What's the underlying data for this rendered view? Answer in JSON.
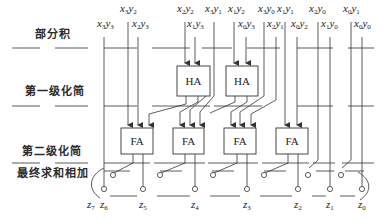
{
  "diagram": {
    "type": "wallace-tree-multiplier-4x4",
    "stage_labels": [
      {
        "id": "partial-products",
        "text": "部分积",
        "x": 35,
        "y": 33
      },
      {
        "id": "first-reduction",
        "text": "第一级化简",
        "x": 25,
        "y": 90
      },
      {
        "id": "second-reduction",
        "text": "第二级化简",
        "x": 22,
        "y": 150
      },
      {
        "id": "final-add",
        "text": "最终求和相加",
        "x": 17,
        "y": 172
      }
    ],
    "partial_products": [
      {
        "x_idx": "3",
        "y_idx": "3",
        "left": 97,
        "top": 26
      },
      {
        "x_idx": "3",
        "y_idx": "2",
        "left": 120,
        "top": 11
      },
      {
        "x_idx": "2",
        "y_idx": "3",
        "left": 132,
        "top": 26
      },
      {
        "x_idx": "2",
        "y_idx": "2",
        "left": 177,
        "top": 11
      },
      {
        "x_idx": "1",
        "y_idx": "3",
        "left": 187,
        "top": 26
      },
      {
        "x_idx": "3",
        "y_idx": "1",
        "left": 205,
        "top": 11
      },
      {
        "x_idx": "1",
        "y_idx": "2",
        "left": 228,
        "top": 11
      },
      {
        "x_idx": "0",
        "y_idx": "3",
        "left": 238,
        "top": 26
      },
      {
        "x_idx": "3",
        "y_idx": "0",
        "left": 258,
        "top": 11
      },
      {
        "x_idx": "1",
        "y_idx": "1",
        "left": 277,
        "top": 11
      },
      {
        "x_idx": "2",
        "y_idx": "1",
        "left": 267,
        "top": 26
      },
      {
        "x_idx": "0",
        "y_idx": "2",
        "left": 291,
        "top": 26
      },
      {
        "x_idx": "2",
        "y_idx": "0",
        "left": 309,
        "top": 11
      },
      {
        "x_idx": "1",
        "y_idx": "0",
        "left": 321,
        "top": 26
      },
      {
        "x_idx": "0",
        "y_idx": "1",
        "left": 343,
        "top": 11
      },
      {
        "x_idx": "0",
        "y_idx": "0",
        "left": 354,
        "top": 26
      }
    ],
    "half_adders": [
      {
        "label": "HA",
        "x": 177,
        "y": 66,
        "w": 33,
        "h": 30
      },
      {
        "label": "HA",
        "x": 226,
        "y": 66,
        "w": 32,
        "h": 30
      }
    ],
    "full_adders": [
      {
        "label": "FA",
        "x": 121,
        "y": 128,
        "w": 32,
        "h": 26
      },
      {
        "label": "FA",
        "x": 173,
        "y": 128,
        "w": 31,
        "h": 26
      },
      {
        "label": "FA",
        "x": 224,
        "y": 128,
        "w": 32,
        "h": 26
      },
      {
        "label": "FA",
        "x": 276,
        "y": 128,
        "w": 32,
        "h": 26
      }
    ],
    "outputs": [
      {
        "name": "z",
        "idx": "7",
        "left": 87,
        "top": 196
      },
      {
        "name": "z",
        "idx": "6",
        "left": 100,
        "top": 196
      },
      {
        "name": "z",
        "idx": "5",
        "left": 139,
        "top": 196
      },
      {
        "name": "z",
        "idx": "4",
        "left": 191,
        "top": 196
      },
      {
        "name": "z",
        "idx": "3",
        "left": 243,
        "top": 196
      },
      {
        "name": "z",
        "idx": "2",
        "left": 294,
        "top": 196
      },
      {
        "name": "z",
        "idx": "1",
        "left": 326,
        "top": 196
      },
      {
        "name": "z",
        "idx": "0",
        "left": 358,
        "top": 196
      }
    ],
    "colors": {
      "line": "#333333",
      "text": "#222222",
      "background": "#ffffff"
    }
  }
}
